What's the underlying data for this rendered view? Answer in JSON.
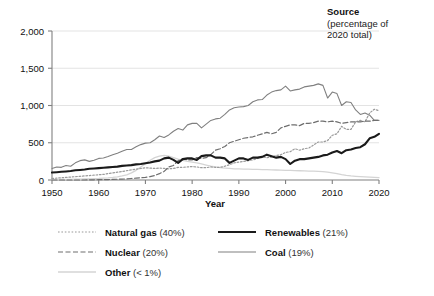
{
  "title_block": {
    "heading": "Source",
    "subtitle_line1": "(percentage of",
    "subtitle_line2": "2020 total)"
  },
  "colors": {
    "renewables": "#1a1a1a",
    "coal": "#808080",
    "nuclear": "#6e6e6e",
    "natural_gas": "#9a9a9a",
    "other": "#d4d4d4",
    "axis": "#808080",
    "grid": "#e3e3e3"
  },
  "legend": {
    "rows": [
      {
        "left": {
          "label": "Natural gas",
          "value": "(40%)",
          "style": "dotted",
          "name": "natural-gas"
        },
        "right": {
          "label": "Renewables",
          "value": "(21%)",
          "style": "solid-thick",
          "name": "renewables"
        }
      },
      {
        "left": {
          "label": "Nuclear",
          "value": "(20%)",
          "style": "dashed",
          "name": "nuclear"
        },
        "right": {
          "label": "Coal",
          "value": "(19%)",
          "style": "solid-thin",
          "name": "coal"
        }
      },
      {
        "left": {
          "label": "Other",
          "value": "(< 1%)",
          "style": "faint",
          "name": "other"
        },
        "right": null
      }
    ]
  },
  "chart_data": {
    "type": "line",
    "title": "Source (percentage of 2020 total)",
    "xlabel": "Year",
    "ylabel": "",
    "xlim": [
      1950,
      2020
    ],
    "ylim": [
      0,
      2000
    ],
    "xticks": [
      1950,
      1960,
      1970,
      1980,
      1990,
      2000,
      2010,
      2020
    ],
    "xtick_labels": [
      "1950",
      "1960",
      "1970",
      "1980",
      "1990",
      "2000",
      "2010",
      "2020"
    ],
    "yticks": [
      0,
      500,
      1000,
      1500,
      2000
    ],
    "ytick_labels": [
      "0",
      "500",
      "1,000",
      "1,500",
      "2,000"
    ],
    "grid": "horizontal",
    "legend_position": "below",
    "x": [
      1950,
      1951,
      1952,
      1953,
      1954,
      1955,
      1956,
      1957,
      1958,
      1959,
      1960,
      1961,
      1962,
      1963,
      1964,
      1965,
      1966,
      1967,
      1968,
      1969,
      1970,
      1971,
      1972,
      1973,
      1974,
      1975,
      1976,
      1977,
      1978,
      1979,
      1980,
      1981,
      1982,
      1983,
      1984,
      1985,
      1986,
      1987,
      1988,
      1989,
      1990,
      1991,
      1992,
      1993,
      1994,
      1995,
      1996,
      1997,
      1998,
      1999,
      2000,
      2001,
      2002,
      2003,
      2004,
      2005,
      2006,
      2007,
      2008,
      2009,
      2010,
      2011,
      2012,
      2013,
      2014,
      2015,
      2016,
      2017,
      2018,
      2019,
      2020
    ],
    "series": [
      {
        "name": "Coal",
        "share_label": "(19%)",
        "style": "solid-thin",
        "color": "#808080",
        "values": [
          155,
          175,
          170,
          195,
          185,
          230,
          260,
          270,
          250,
          265,
          290,
          295,
          315,
          340,
          360,
          385,
          410,
          410,
          445,
          475,
          495,
          500,
          540,
          590,
          570,
          605,
          655,
          690,
          670,
          740,
          760,
          760,
          700,
          750,
          800,
          820,
          830,
          880,
          940,
          970,
          980,
          985,
          1000,
          1050,
          1075,
          1080,
          1140,
          1180,
          1200,
          1210,
          1260,
          1195,
          1210,
          1220,
          1250,
          1260,
          1270,
          1290,
          1270,
          1100,
          1180,
          1160,
          1000,
          1050,
          1040,
          940,
          880,
          900,
          870,
          800,
          800
        ]
      },
      {
        "name": "Natural gas",
        "share_label": "(40%)",
        "style": "dotted",
        "color": "#9a9a9a",
        "values": [
          20,
          25,
          30,
          35,
          40,
          45,
          50,
          55,
          60,
          65,
          70,
          75,
          85,
          95,
          105,
          115,
          125,
          135,
          145,
          155,
          165,
          160,
          155,
          160,
          155,
          150,
          155,
          170,
          170,
          175,
          180,
          175,
          165,
          165,
          175,
          170,
          170,
          185,
          205,
          230,
          240,
          250,
          260,
          270,
          290,
          310,
          300,
          310,
          330,
          340,
          370,
          380,
          420,
          400,
          420,
          430,
          470,
          510,
          510,
          530,
          600,
          620,
          720,
          680,
          680,
          780,
          800,
          780,
          900,
          950,
          930
        ]
      },
      {
        "name": "Nuclear",
        "share_label": "(20%)",
        "style": "dashed",
        "color": "#6e6e6e",
        "values": [
          0,
          0,
          0,
          0,
          0,
          0,
          0,
          0,
          2,
          3,
          4,
          5,
          6,
          8,
          10,
          12,
          15,
          20,
          25,
          30,
          35,
          45,
          60,
          85,
          115,
          175,
          195,
          260,
          285,
          270,
          270,
          300,
          290,
          300,
          340,
          400,
          420,
          450,
          500,
          520,
          540,
          560,
          570,
          580,
          600,
          620,
          640,
          620,
          640,
          700,
          720,
          740,
          740,
          730,
          760,
          760,
          770,
          790,
          790,
          780,
          790,
          780,
          760,
          770,
          780,
          780,
          780,
          790,
          790,
          800,
          800
        ]
      },
      {
        "name": "Renewables",
        "share_label": "(21%)",
        "style": "solid-thick",
        "color": "#1a1a1a",
        "values": [
          100,
          105,
          110,
          115,
          120,
          130,
          135,
          140,
          150,
          155,
          160,
          165,
          170,
          175,
          180,
          190,
          195,
          200,
          210,
          215,
          225,
          235,
          250,
          260,
          290,
          300,
          270,
          230,
          280,
          290,
          290,
          270,
          320,
          330,
          330,
          300,
          300,
          290,
          230,
          260,
          290,
          290,
          270,
          300,
          300,
          310,
          340,
          320,
          300,
          310,
          280,
          215,
          260,
          280,
          280,
          290,
          300,
          310,
          330,
          340,
          370,
          390,
          360,
          400,
          410,
          430,
          440,
          480,
          560,
          580,
          620
        ]
      },
      {
        "name": "Other",
        "share_label": "(< 1%)",
        "style": "faint",
        "color": "#d4d4d4",
        "values": [
          5,
          6,
          7,
          8,
          9,
          10,
          12,
          14,
          16,
          18,
          20,
          24,
          28,
          34,
          42,
          55,
          70,
          95,
          130,
          175,
          220,
          265,
          300,
          320,
          330,
          320,
          300,
          280,
          265,
          250,
          240,
          230,
          215,
          200,
          185,
          175,
          165,
          160,
          155,
          150,
          148,
          146,
          145,
          143,
          142,
          140,
          138,
          136,
          134,
          132,
          130,
          128,
          126,
          124,
          122,
          120,
          118,
          116,
          112,
          105,
          95,
          85,
          72,
          62,
          55,
          50,
          46,
          42,
          38,
          35,
          32
        ]
      }
    ]
  }
}
